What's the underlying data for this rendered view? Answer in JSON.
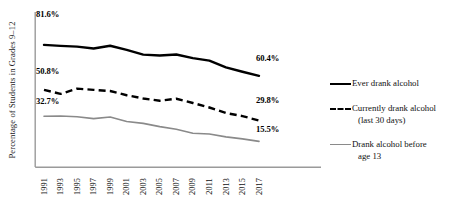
{
  "chart_data": {
    "type": "line",
    "title": "",
    "subtitle": "",
    "xlabel": "",
    "ylabel": "Percentage of Students in Grades 9–12",
    "grid": false,
    "legend_position": "right",
    "xlim": [
      1991,
      2017
    ],
    "ylim": [
      0,
      100
    ],
    "x": [
      1991,
      1993,
      1995,
      1997,
      1999,
      2001,
      2003,
      2005,
      2007,
      2009,
      2011,
      2013,
      2015,
      2017
    ],
    "categories": [
      "1991",
      "1993",
      "1995",
      "1997",
      "1999",
      "2001",
      "2003",
      "2005",
      "2007",
      "2009",
      "2011",
      "2013",
      "2015",
      "2017"
    ],
    "series": [
      {
        "name": "Ever drank alcohol",
        "style": "solid",
        "color": "#000000",
        "width": 2.4,
        "values": [
          81.6,
          80.9,
          80.4,
          79.1,
          81.0,
          78.2,
          74.9,
          74.3,
          75.0,
          72.5,
          70.8,
          66.2,
          63.2,
          60.4
        ],
        "start_label": "81.6%",
        "end_label": "60.4%"
      },
      {
        "name": "Currently drank alcohol (last 30 days)",
        "style": "dashed",
        "color": "#000000",
        "width": 2.4,
        "values": [
          50.8,
          48.0,
          51.6,
          50.8,
          50.0,
          47.1,
          44.9,
          43.3,
          44.7,
          41.8,
          38.7,
          34.9,
          32.8,
          29.8
        ],
        "start_label": "50.8%",
        "end_label": "29.8%"
      },
      {
        "name": "Drank alcohol before age 13",
        "style": "solid",
        "color": "#8a8a8a",
        "width": 1.6,
        "values": [
          32.7,
          32.9,
          32.4,
          31.1,
          32.2,
          29.1,
          27.8,
          25.6,
          23.8,
          21.1,
          20.5,
          18.6,
          17.2,
          15.5
        ],
        "start_label": "32.7%",
        "end_label": "15.5%"
      }
    ],
    "data_labels": [
      {
        "text": "81.6%",
        "series": "Ever drank alcohol",
        "position": "start"
      },
      {
        "text": "60.4%",
        "series": "Ever drank alcohol",
        "position": "end"
      },
      {
        "text": "50.8%",
        "series": "Currently drank alcohol (last 30 days)",
        "position": "start"
      },
      {
        "text": "29.8%",
        "series": "Currently drank alcohol (last 30 days)",
        "position": "end"
      },
      {
        "text": "32.7%",
        "series": "Drank alcohol before age 13",
        "position": "start"
      },
      {
        "text": "15.5%",
        "series": "Drank alcohol before age 13",
        "position": "end"
      }
    ]
  },
  "axis": {
    "y_title": "Percentage of Students in Grades 9–12",
    "x_ticks": [
      "1991",
      "1993",
      "1995",
      "1997",
      "1999",
      "2001",
      "2003",
      "2005",
      "2007",
      "2009",
      "2011",
      "2013",
      "2015",
      "2017"
    ]
  },
  "labels": {
    "ever_start": "81.6%",
    "ever_end": "60.4%",
    "current_start": "50.8%",
    "current_end": "29.8%",
    "before13_start": "32.7%",
    "before13_end": "15.5%"
  },
  "legend": {
    "items": [
      {
        "label": "Ever drank alcohol",
        "label_line2": "",
        "marker": "solid-black-line-icon"
      },
      {
        "label": "Currently drank alcohol",
        "label_line2": "(last 30 days)",
        "marker": "dashed-black-line-icon"
      },
      {
        "label": "Drank alcohol before",
        "label_line2": "age 13",
        "marker": "solid-gray-line-icon"
      }
    ]
  },
  "colors": {
    "series_1": "#000000",
    "series_2": "#000000",
    "series_3": "#8a8a8a",
    "axis": "#808080",
    "text": "#111111",
    "background": "#ffffff"
  }
}
